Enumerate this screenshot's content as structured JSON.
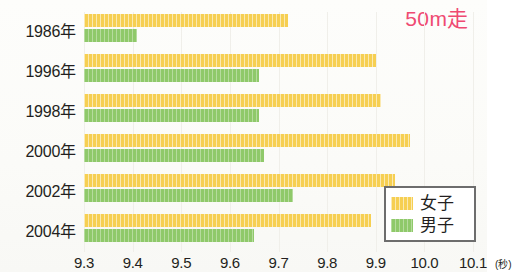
{
  "title": "50m走",
  "title_color": "#ef4a72",
  "legend": {
    "position": "bottom-right",
    "items": [
      {
        "label": "女子",
        "color": "#f6cf52",
        "swatch_name": "legend-swatch-female"
      },
      {
        "label": "男子",
        "color": "#8fc96a",
        "swatch_name": "legend-swatch-male"
      }
    ]
  },
  "axis": {
    "unit": "(秒)",
    "ticks": [
      "9.3",
      "9.4",
      "9.5",
      "9.6",
      "9.7",
      "9.8",
      "9.9",
      "10.0",
      "10.1"
    ]
  },
  "chart_data": {
    "type": "bar",
    "orientation": "horizontal",
    "title": "50m走",
    "xlabel": "(秒)",
    "ylabel": "",
    "xlim": [
      9.3,
      10.1
    ],
    "grid": true,
    "categories": [
      "1986年",
      "1996年",
      "1998年",
      "2000年",
      "2002年",
      "2004年"
    ],
    "series": [
      {
        "name": "女子",
        "color": "#f6cf52",
        "values": [
          9.72,
          9.9,
          9.91,
          9.97,
          9.94,
          9.89
        ]
      },
      {
        "name": "男子",
        "color": "#8fc96a",
        "values": [
          9.41,
          9.66,
          9.66,
          9.67,
          9.73,
          9.65
        ]
      }
    ]
  }
}
